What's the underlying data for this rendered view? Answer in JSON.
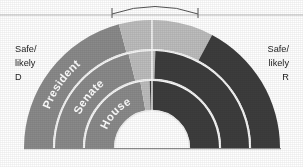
{
  "chart_data": {
    "type": "pie",
    "title": "",
    "subtitle": "",
    "variant": "semicircular-nested-donut",
    "orientation": "half-circle-up",
    "legend_position": "inline-sides",
    "grid": false,
    "center": {
      "x": 152,
      "y": 148
    },
    "baseline_y": 148,
    "top_rule_y": 15,
    "left_annotation": {
      "line1": "Safe/",
      "line2": "likely",
      "line3": "D"
    },
    "right_annotation": {
      "line1": "Safe/",
      "line2": "likely",
      "line3": "R"
    },
    "categories": [
      "Safe/likely D",
      "Toss-up",
      "Safe/likely R"
    ],
    "colors": {
      "safe_d": "#8a8a8a",
      "tossup": "#bdbdbd",
      "safe_r": "#3d3d3d",
      "background": "#ffffff",
      "rule": "#b4b4b4",
      "divider": "#e8e8e8",
      "text": "#1b1b1b",
      "arc_label_text": "#ffffff",
      "bracket": "#555555"
    },
    "rings": [
      {
        "name": "President",
        "label": "President",
        "ring_index": 0,
        "outer_radius": 128,
        "inner_radius": 99,
        "series": [
          {
            "name": "Safe/likely D",
            "start_deg": 180,
            "end_deg": 105,
            "color": "#8a8a8a"
          },
          {
            "name": "Toss-up",
            "start_deg": 105,
            "end_deg": 62,
            "color": "#bdbdbd"
          },
          {
            "name": "Safe/likely R",
            "start_deg": 62,
            "end_deg": 0,
            "color": "#3d3d3d"
          }
        ]
      },
      {
        "name": "Senate",
        "label": "Senate",
        "ring_index": 1,
        "outer_radius": 97,
        "inner_radius": 69,
        "series": [
          {
            "name": "Safe/likely D",
            "start_deg": 180,
            "end_deg": 104,
            "color": "#8a8a8a"
          },
          {
            "name": "Toss-up",
            "start_deg": 104,
            "end_deg": 88,
            "color": "#bdbdbd"
          },
          {
            "name": "Safe/likely R",
            "start_deg": 88,
            "end_deg": 0,
            "color": "#3d3d3d"
          }
        ]
      },
      {
        "name": "House",
        "label": "House",
        "ring_index": 2,
        "outer_radius": 67,
        "inner_radius": 38,
        "series": [
          {
            "name": "Safe/likely D",
            "start_deg": 180,
            "end_deg": 100,
            "color": "#8a8a8a"
          },
          {
            "name": "Toss-up",
            "start_deg": 100,
            "end_deg": 92,
            "color": "#bdbdbd"
          },
          {
            "name": "Safe/likely R",
            "start_deg": 92,
            "end_deg": 0,
            "color": "#3d3d3d"
          }
        ]
      }
    ],
    "bracket": {
      "label": "",
      "x_start": 112,
      "x_end": 198,
      "baseline_y": 15,
      "peak_y": 4,
      "tick_height": 7
    },
    "center_divider": {
      "x": 152,
      "y_top": 16,
      "y_bottom": 148
    }
  },
  "labels": {
    "president": "President",
    "senate": "Senate",
    "house": "House"
  }
}
